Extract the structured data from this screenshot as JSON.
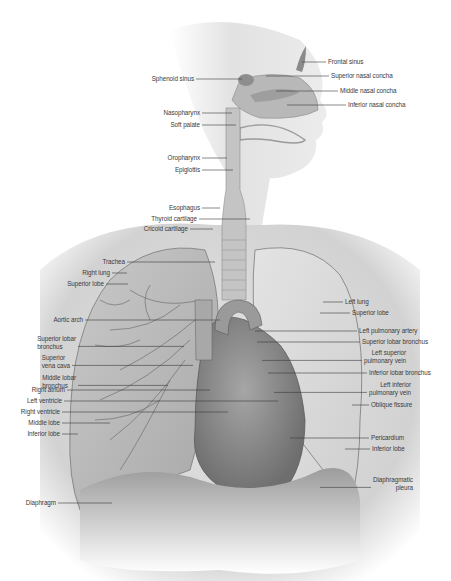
{
  "diagram": {
    "colors": {
      "background": "#ffffff",
      "body_shade": "#d6d6d6",
      "lung": "#bdbdbd",
      "heart": "#8e8e8e",
      "leader_line": "#3a3a3a",
      "label_text": "#3a3a3a"
    },
    "labels_left": [
      {
        "id": "sphenoid-sinus",
        "text": "Sphenoid sinus",
        "x": 196,
        "y": 79,
        "tx": 242
      },
      {
        "id": "nasopharynx",
        "text": "Nasopharynx",
        "x": 202,
        "y": 113,
        "tx": 232
      },
      {
        "id": "soft-palate",
        "text": "Soft palate",
        "x": 202,
        "y": 125,
        "tx": 236
      },
      {
        "id": "oropharynx",
        "text": "Oropharynx",
        "x": 202,
        "y": 158,
        "tx": 227
      },
      {
        "id": "epiglottis",
        "text": "Epiglottis",
        "x": 202,
        "y": 170,
        "tx": 233
      },
      {
        "id": "esophagus",
        "text": "Esophagus",
        "x": 202,
        "y": 208,
        "tx": 220
      },
      {
        "id": "thyroid-cartilage",
        "text": "Thyroid cartilage",
        "x": 199,
        "y": 219,
        "tx": 250
      },
      {
        "id": "cricoid-cartilage",
        "text": "Cricoid cartilage",
        "x": 190,
        "y": 229,
        "tx": 213
      },
      {
        "id": "trachea",
        "text": "Trachea",
        "x": 127,
        "y": 262,
        "tx": 215
      },
      {
        "id": "right-lung",
        "text": "Right lung",
        "x": 112,
        "y": 273,
        "tx": 127
      },
      {
        "id": "superior-lobe-right",
        "text": "Superior lobe",
        "x": 106,
        "y": 284,
        "tx": 128
      },
      {
        "id": "aortic-arch",
        "text": "Aortic arch",
        "x": 85,
        "y": 320,
        "tx": 220
      },
      {
        "id": "superior-lobar-bronchus-right",
        "text": "Superior lobar\nbronchus",
        "x": 78,
        "y": 339,
        "tx": 184
      },
      {
        "id": "superior-vena-cava",
        "text": "Superior\nvena cava",
        "x": 72,
        "y": 358,
        "tx": 193
      },
      {
        "id": "middle-lobar-bronchus",
        "text": "Middle lobar\nbronchus",
        "x": 78,
        "y": 378,
        "tx": 168
      },
      {
        "id": "right-atrium",
        "text": "Right atrium",
        "x": 67,
        "y": 390,
        "tx": 210
      },
      {
        "id": "left-ventricle",
        "text": "Left ventricle",
        "x": 64,
        "y": 401,
        "tx": 278
      },
      {
        "id": "right-ventricle",
        "text": "Right ventricle",
        "x": 62,
        "y": 412,
        "tx": 228
      },
      {
        "id": "middle-lobe",
        "text": "Middle lobe",
        "x": 62,
        "y": 423,
        "tx": 110
      },
      {
        "id": "inferior-lobe-right",
        "text": "Inferior lobe",
        "x": 62,
        "y": 434,
        "tx": 78
      },
      {
        "id": "diaphragm",
        "text": "Diaphragm",
        "x": 58,
        "y": 503,
        "tx": 112
      }
    ],
    "labels_right": [
      {
        "id": "frontal-sinus",
        "text": "Frontal sinus",
        "x": 326,
        "y": 62,
        "tx": 302
      },
      {
        "id": "superior-nasal-concha",
        "text": "Superior nasal concha",
        "x": 329,
        "y": 76,
        "tx": 266
      },
      {
        "id": "middle-nasal-concha",
        "text": "Middle nasal concha",
        "x": 338,
        "y": 91,
        "tx": 276
      },
      {
        "id": "inferior-nasal-concha",
        "text": "Inferior nasal concha",
        "x": 346,
        "y": 105,
        "tx": 287
      },
      {
        "id": "left-lung",
        "text": "Left lung",
        "x": 343,
        "y": 302,
        "tx": 323
      },
      {
        "id": "superior-lobe-left",
        "text": "Superior lobe",
        "x": 350,
        "y": 313,
        "tx": 320
      },
      {
        "id": "left-pulmonary-artery",
        "text": "Left pulmonary artery",
        "x": 357,
        "y": 331,
        "tx": 255
      },
      {
        "id": "superior-lobar-bronchus-left",
        "text": "Superior lobar bronchus",
        "x": 360,
        "y": 342,
        "tx": 257
      },
      {
        "id": "left-superior-pulmonary-vein",
        "text": "Left superior\npulmonary vein",
        "x": 362,
        "y": 353,
        "tx": 262
      },
      {
        "id": "inferior-lobar-bronchus",
        "text": "Inferior lobar bronchus",
        "x": 367,
        "y": 373,
        "tx": 268
      },
      {
        "id": "left-inferior-pulmonary-vein",
        "text": "Left inferior\npulmonary vein",
        "x": 367,
        "y": 385,
        "tx": 274
      },
      {
        "id": "oblique-fissure",
        "text": "Oblique fissure",
        "x": 369,
        "y": 405,
        "tx": 352
      },
      {
        "id": "pericardium",
        "text": "Pericardium",
        "x": 369,
        "y": 438,
        "tx": 290
      },
      {
        "id": "inferior-lobe-left",
        "text": "Inferior lobe",
        "x": 370,
        "y": 449,
        "tx": 345
      },
      {
        "id": "diaphragmatic-pleura",
        "text": "Diaphragmatic\npleura",
        "x": 371,
        "y": 480,
        "tx": 320
      }
    ]
  }
}
